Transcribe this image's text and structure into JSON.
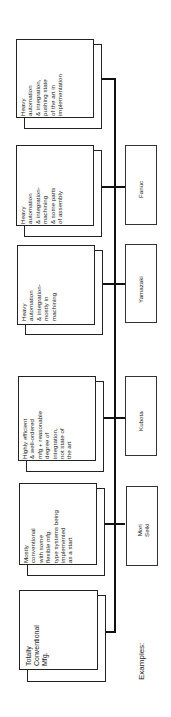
{
  "diagram": {
    "stages": [
      {
        "id": "stage-1",
        "label": "Totally\nConventional\nMfg."
      },
      {
        "id": "stage-2",
        "label": "Mostly\nconventional\nwith some\nflexible mfg.\ntype systems being\nimplemented\nas a start"
      },
      {
        "id": "stage-3",
        "label": "Highly efficient\n& well-ordered\nmfg + reasonable\ndegree of\nintegration,\nnot state of\nthe art"
      },
      {
        "id": "stage-4",
        "label": "Heavy\nautomation\n& integration-\nmostly in\nmachining"
      },
      {
        "id": "stage-5",
        "label": "Heavy\nautomation\n& integration-\nmachining\n& some parts\nof assembly"
      },
      {
        "id": "stage-6",
        "label": "Heavy\nautomation\n& integration,\npushing state\nof the art in\nimplementation"
      }
    ],
    "examples_label": "Examples:",
    "examples": [
      {
        "stage": "stage-2",
        "label": "Mori\nSeiki"
      },
      {
        "stage": "stage-3",
        "label": "Kubota"
      },
      {
        "stage": "stage-4",
        "label": "Yamazaki"
      },
      {
        "stage": "stage-5",
        "label": "Fanuc"
      }
    ]
  }
}
